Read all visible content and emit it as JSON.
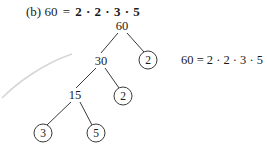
{
  "page": {
    "background_color": "#ffffff",
    "ink_color": "#1a1a1a",
    "line_color": "#3a3a3a",
    "artifact_color": "#d6d6d6"
  },
  "top_equation": {
    "part_label": "(b)",
    "left_side": "60",
    "equals": "=",
    "right_side": "2 · 2 · 3 · 5",
    "right_side_bold": true
  },
  "side_equation": {
    "text": "60 = 2 · 2 · 3 · 5"
  },
  "chart_data": {
    "type": "diagram",
    "subtype": "factor-tree",
    "root": "60",
    "result": "60 = 2 · 2 · 3 · 5",
    "prime_factors": [
      "2",
      "2",
      "3",
      "5"
    ],
    "nodes": [
      {
        "id": "n60",
        "label": "60",
        "style": "plain",
        "x": 122,
        "y": 26
      },
      {
        "id": "n30",
        "label": "30",
        "style": "plain",
        "x": 101,
        "y": 61
      },
      {
        "id": "p2a",
        "label": "2",
        "style": "circled",
        "x": 148,
        "y": 60
      },
      {
        "id": "n15",
        "label": "15",
        "style": "plain",
        "x": 75,
        "y": 95
      },
      {
        "id": "p2b",
        "label": "2",
        "style": "circled",
        "x": 123,
        "y": 96
      },
      {
        "id": "p3",
        "label": "3",
        "style": "circled",
        "x": 43,
        "y": 133
      },
      {
        "id": "p5",
        "label": "5",
        "style": "circled",
        "x": 96,
        "y": 133
      }
    ],
    "edges": [
      {
        "from": "n60",
        "to": "n30",
        "x1": 118,
        "y1": 33,
        "x2": 101,
        "y2": 53
      },
      {
        "from": "n60",
        "to": "p2a",
        "x1": 127,
        "y1": 33,
        "x2": 144,
        "y2": 52
      },
      {
        "from": "n30",
        "to": "n15",
        "x1": 96,
        "y1": 68,
        "x2": 76,
        "y2": 88
      },
      {
        "from": "n30",
        "to": "p2b",
        "x1": 105,
        "y1": 68,
        "x2": 119,
        "y2": 88
      },
      {
        "from": "n15",
        "to": "p3",
        "x1": 71,
        "y1": 102,
        "x2": 47,
        "y2": 125
      },
      {
        "from": "n15",
        "to": "p5",
        "x1": 80,
        "y1": 102,
        "x2": 92,
        "y2": 125
      }
    ],
    "scan_artifact": {
      "description": "faint gray curved arc scanning artifact at left",
      "path": "M 2 98 C 16 84, 42 64, 72 54"
    }
  }
}
